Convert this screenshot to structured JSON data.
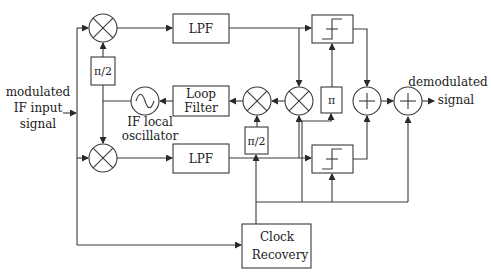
{
  "diagram": {
    "input_label": [
      "modulated",
      "IF input",
      "signal"
    ],
    "output_label": [
      "demodulated",
      "signal"
    ],
    "blocks": {
      "lpf_top": "LPF",
      "lpf_bottom": "LPF",
      "phase_shift_top": "π/2",
      "phase_shift_mid": "π/2",
      "phase_pi": "π",
      "loop_filter": [
        "Loop",
        "Filter"
      ],
      "oscillator_label": [
        "IF local",
        "oscillator"
      ],
      "clock_recovery": [
        "Clock",
        "Recovery"
      ],
      "decision_top": "slicer",
      "decision_bottom": "slicer"
    },
    "icons": {
      "multiplier": "⊗",
      "adder": "⊕",
      "oscillator": "∿"
    },
    "colors": {
      "line": "#3a3a3a",
      "text": "#222222",
      "background": "#ffffff"
    }
  }
}
